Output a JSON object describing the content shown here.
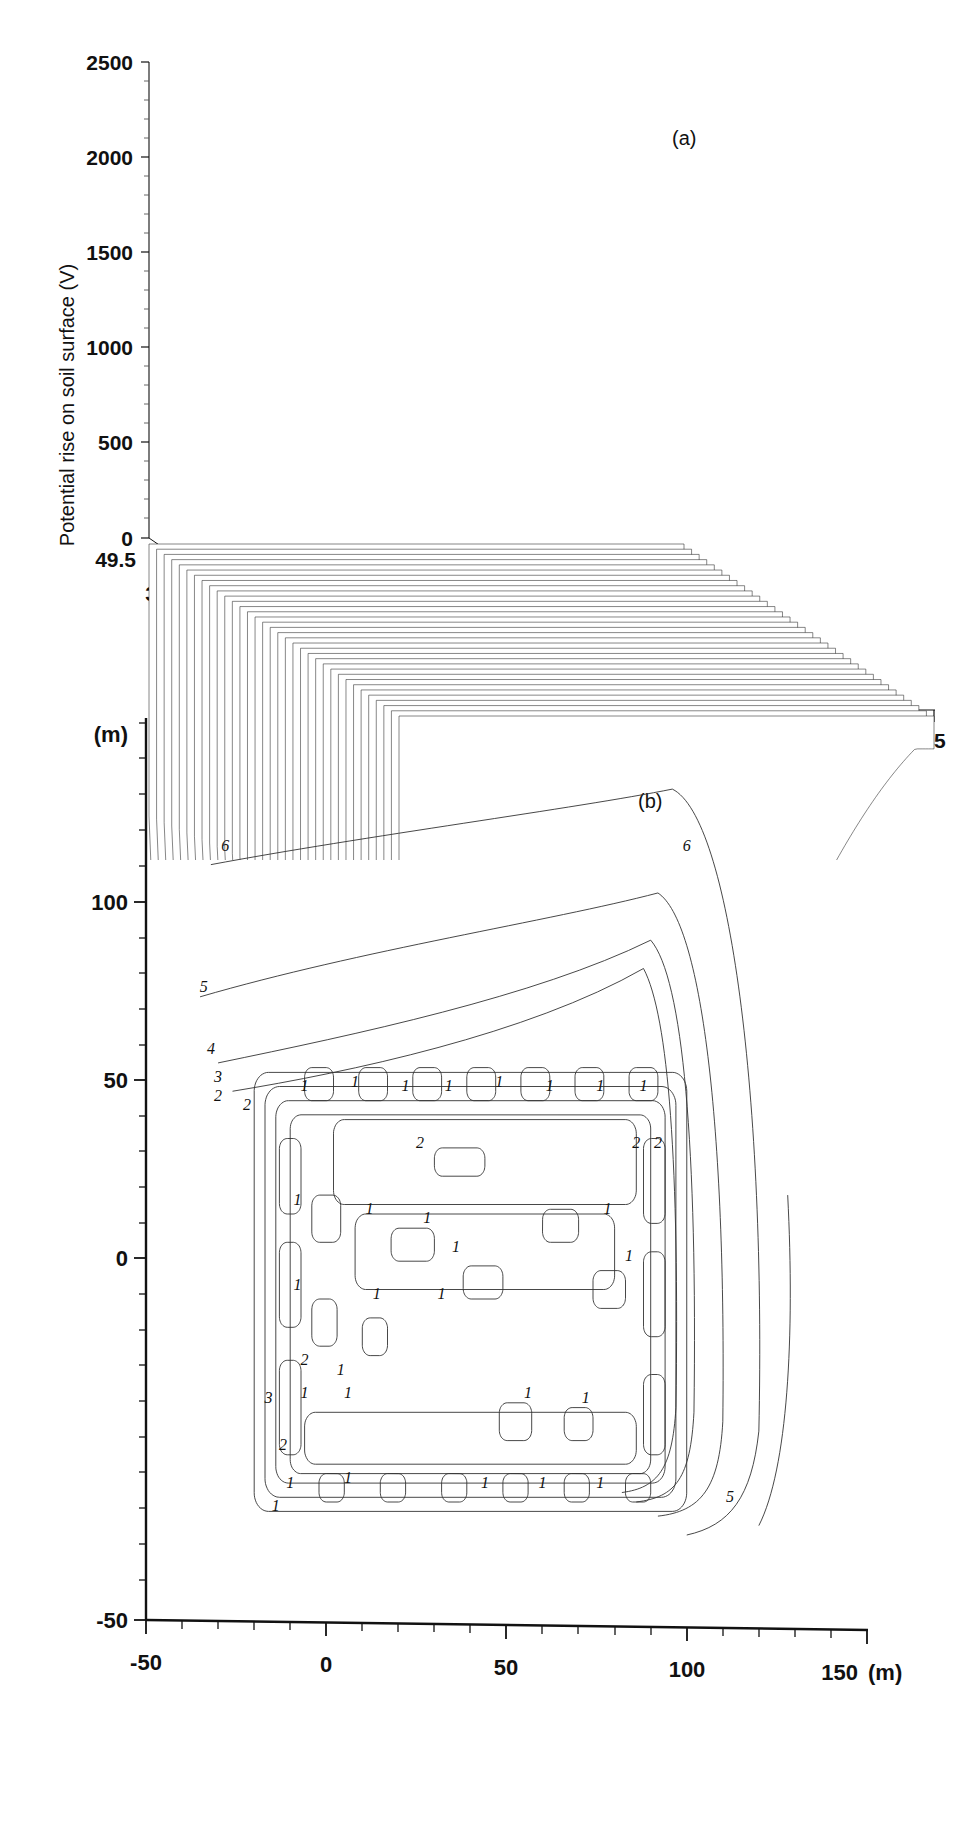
{
  "figure": {
    "panel_a_label": "(a)",
    "panel_b_label": "(b)"
  },
  "panel_a": {
    "ylabel": "Potential rise on soil surface (V)",
    "depth_axis_title": "Distance (m)",
    "y_ticks": [
      "0",
      "500",
      "1000",
      "1500",
      "2000",
      "2500"
    ],
    "depth_ticks": [
      "49.5",
      "39.6",
      "29.7",
      "19.8",
      "9.9",
      "0"
    ],
    "x_ticks": [
      "0",
      "15",
      "30",
      "45"
    ]
  },
  "panel_b": {
    "y_unit_label": "(m)",
    "x_unit_label": "(m)",
    "y_ticks": [
      "-50",
      "0",
      "50",
      "100"
    ],
    "x_ticks": [
      "-50",
      "0",
      "50",
      "100",
      "150"
    ],
    "contour_labels": [
      "6",
      "5",
      "4",
      "3",
      "2",
      "1",
      "1",
      "1",
      "1",
      "1",
      "1",
      "1",
      "1",
      "2",
      "2",
      "2",
      "1",
      "1",
      "1",
      "1",
      "1",
      "3",
      "1",
      "1",
      "2",
      "1",
      "1",
      "1",
      "1",
      "5",
      "6",
      "2",
      "4",
      "3"
    ]
  },
  "chart_data": [
    {
      "type": "line",
      "id": "panel-a-waterfall-surface",
      "title": "(a)",
      "subtitle": "3-D waterfall mesh of soil-surface potential rise",
      "xlabel": "",
      "ylabel": "Potential rise on soil surface (V)",
      "zlabel": "Distance (m)",
      "xlim": [
        0,
        48
      ],
      "ylim": [
        0,
        2500
      ],
      "zlim": [
        0,
        49.5
      ],
      "x_tick_values": [
        0,
        15,
        30,
        45
      ],
      "x_minor_tick_step": 3,
      "y_tick_values": [
        0,
        500,
        1000,
        1500,
        2000,
        2500
      ],
      "y_minor_tick_step": 100,
      "z_tick_values": [
        0,
        9.9,
        19.8,
        29.7,
        39.6,
        49.5
      ],
      "z_minor_tick_step": 1.65,
      "grid": false,
      "legend": "none",
      "n_profiles": 34,
      "series": [
        {
          "name": "profile z=0",
          "x": [
            0,
            2,
            4,
            6,
            8,
            10,
            12,
            14,
            16,
            18,
            20,
            22,
            24,
            26,
            28,
            30,
            32,
            34,
            36,
            38,
            40,
            42,
            44,
            46,
            48
          ],
          "values": [
            690,
            700,
            700,
            700,
            700,
            700,
            700,
            700,
            700,
            700,
            700,
            700,
            690,
            680,
            665,
            650,
            630,
            605,
            575,
            540,
            500,
            455,
            405,
            350,
            290
          ]
        },
        {
          "name": "profile z=24.75",
          "x": [
            0,
            2,
            4,
            6,
            8,
            10,
            12,
            14,
            16,
            18,
            20,
            22,
            24,
            26,
            28,
            30,
            32,
            34,
            36,
            38,
            40,
            42,
            44,
            46,
            48
          ],
          "values": [
            760,
            1480,
            1180,
            1230,
            1620,
            1230,
            1300,
            1700,
            1330,
            1680,
            1340,
            1700,
            1340,
            1690,
            1330,
            1640,
            1290,
            1500,
            1210,
            1080,
            930,
            780,
            620,
            470,
            330
          ]
        },
        {
          "name": "profile z=49.5",
          "x": [
            0,
            2,
            4,
            6,
            8,
            10,
            12,
            14,
            16,
            18,
            20,
            22,
            24,
            26,
            28,
            30,
            32,
            34,
            36,
            38,
            40,
            42,
            44,
            46,
            48
          ],
          "values": [
            800,
            1760,
            1300,
            1380,
            1800,
            1360,
            1430,
            1840,
            1470,
            1830,
            1480,
            1840,
            1470,
            1820,
            1460,
            1780,
            1400,
            1620,
            1300,
            1150,
            980,
            820,
            650,
            490,
            350
          ]
        }
      ],
      "annotations": [
        "Regular ripple peaks ~1800 V along the earthing grid; steep fall-off to ~300 V at far edge"
      ]
    },
    {
      "type": "line",
      "id": "panel-b-equipotential-contours",
      "title": "(b)",
      "subtitle": "Equipotential contour map on soil surface",
      "xlabel": "(m)",
      "ylabel": "(m)",
      "xlim": [
        -50,
        158
      ],
      "ylim": [
        -50,
        142
      ],
      "x_tick_values": [
        -50,
        0,
        50,
        100,
        150
      ],
      "x_minor_tick_step": 10,
      "y_tick_values": [
        -50,
        0,
        50,
        100
      ],
      "y_minor_tick_step": 10,
      "grid": false,
      "legend": "none",
      "contour_levels": [
        1,
        2,
        3,
        4,
        5,
        6
      ],
      "annotations": [
        "Grid conductors occupy approx x -15..95 m, y -22..65 m",
        "Outer contours 5 and 6 extend to upper-left and right of the grid"
      ]
    }
  ]
}
